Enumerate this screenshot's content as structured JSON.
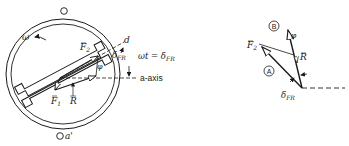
{
  "left_figure": {
    "stator_top_slot_label": "",
    "stator_bottom_slot_label": "a'",
    "rotation_label": "ω",
    "vector_F2_label": "F",
    "vector_F2_sub": "2",
    "vector_F1_label": "F",
    "vector_F1_sub": "1",
    "vector_R_label": "R",
    "angle_phi_label": "φ",
    "d_axis_label": "d",
    "delta_label": "δ",
    "delta_sub": "FR",
    "equation_lhs": "ωt = δ",
    "equation_sub": "FR",
    "a_axis_label": "a-axis"
  },
  "right_figure": {
    "circle_B_label": "B",
    "circle_A_label": "A",
    "phi_label": "φ",
    "vector_F2_label": "F",
    "vector_F2_sub": "2",
    "vector_R_label": "R",
    "delta_label": "δ",
    "delta_sub": "FR"
  },
  "colors": {
    "ink": "#1a1a1a",
    "background": "#ffffff"
  }
}
